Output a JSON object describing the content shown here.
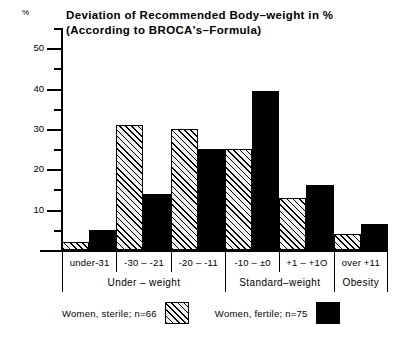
{
  "chart_data": {
    "type": "bar",
    "title": "Deviation of Recommended Body–weight in %",
    "subtitle": "(According to BROCA's–Formula)",
    "xlabel": "",
    "ylabel": "%",
    "ylim": [
      0,
      55
    ],
    "yticks_major": [
      10,
      20,
      30,
      40,
      50
    ],
    "yticks_minor": [
      5,
      15,
      25,
      35,
      45,
      55
    ],
    "grid": false,
    "legend_position": "bottom",
    "categories": [
      "under-31",
      "-30 – -21",
      "-20 – -11",
      "-10 – ±0",
      "+1  –  +1O",
      "over +11"
    ],
    "series": [
      {
        "name": "Women, sterile; n=66",
        "pattern": "hatched",
        "values": [
          2,
          31,
          30,
          25,
          13,
          4
        ]
      },
      {
        "name": "Women, fertile; n=75",
        "pattern": "solid",
        "values": [
          5,
          14,
          25,
          39.5,
          16,
          6.5
        ]
      }
    ],
    "groups": [
      {
        "label": "Under – weight",
        "span": 3
      },
      {
        "label": "Standard–weight",
        "span": 2
      },
      {
        "label": "Obesity",
        "span": 1
      }
    ]
  },
  "axis": {
    "unit_symbol": "%"
  },
  "legend": {
    "entries": [
      {
        "label": "Women, sterile; n=66",
        "pattern": "hatched"
      },
      {
        "label": "Women, fertile; n=75",
        "pattern": "solid"
      }
    ]
  },
  "colors": {
    "ink": "#000000",
    "paper": "#ffffff",
    "hatch_fill": "#f2f2f2"
  }
}
